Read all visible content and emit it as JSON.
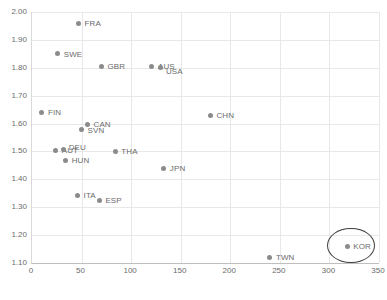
{
  "chart_data": {
    "type": "scatter",
    "title": "",
    "subtitle": "",
    "xlabel": "",
    "ylabel": "",
    "xlim": [
      0,
      350
    ],
    "ylim": [
      1.1,
      2.0
    ],
    "xticks": [
      "0",
      "50",
      "100",
      "150",
      "200",
      "250",
      "300",
      "350"
    ],
    "xtick_values": [
      0,
      50,
      100,
      150,
      200,
      250,
      300,
      350
    ],
    "yticks": [
      "1.10",
      "1.20",
      "1.30",
      "1.40",
      "1.50",
      "1.60",
      "1.70",
      "1.80",
      "1.90",
      "2.00"
    ],
    "ytick_values": [
      1.1,
      1.2,
      1.3,
      1.4,
      1.5,
      1.6,
      1.7,
      1.8,
      1.9,
      2.0
    ],
    "grid": true,
    "legend": "none",
    "point_color": "#8b8b8b",
    "label_color": "#6b6b6b",
    "points": [
      {
        "label": "FRA",
        "x": 47,
        "y": 1.96,
        "label_dx": 6,
        "label_dy": -4
      },
      {
        "label": "SWE",
        "x": 26,
        "y": 1.85,
        "label_dx": 6,
        "label_dy": -4
      },
      {
        "label": "GBR",
        "x": 70,
        "y": 1.805,
        "label_dx": 6,
        "label_dy": -4
      },
      {
        "label": "AUS",
        "x": 121,
        "y": 1.805,
        "label_dx": 6,
        "label_dy": -4
      },
      {
        "label": "USA",
        "x": 130,
        "y": 1.8,
        "label_dx": 5,
        "label_dy": -1
      },
      {
        "label": "FIN",
        "x": 10,
        "y": 1.64,
        "label_dx": 6,
        "label_dy": -4
      },
      {
        "label": "CHN",
        "x": 180,
        "y": 1.63,
        "label_dx": 6,
        "label_dy": -4
      },
      {
        "label": "CAN",
        "x": 56,
        "y": 1.598,
        "label_dx": 6,
        "label_dy": -4
      },
      {
        "label": "SVN",
        "x": 50,
        "y": 1.578,
        "label_dx": 6,
        "label_dy": -4
      },
      {
        "label": "AUT",
        "x": 24,
        "y": 1.505,
        "label_dx": 6,
        "label_dy": -4
      },
      {
        "label": "DEU",
        "x": 32,
        "y": 1.508,
        "label_dx": 5,
        "label_dy": -6
      },
      {
        "label": "THA",
        "x": 84,
        "y": 1.5,
        "label_dx": 6,
        "label_dy": -4
      },
      {
        "label": "HUN",
        "x": 34,
        "y": 1.468,
        "label_dx": 6,
        "label_dy": -4
      },
      {
        "label": "JPN",
        "x": 133,
        "y": 1.44,
        "label_dx": 6,
        "label_dy": -4
      },
      {
        "label": "ITA",
        "x": 46,
        "y": 1.343,
        "label_dx": 6,
        "label_dy": -4
      },
      {
        "label": "ESP",
        "x": 68,
        "y": 1.325,
        "label_dx": 6,
        "label_dy": -4
      },
      {
        "label": "KOR",
        "x": 318,
        "y": 1.16,
        "label_dx": 6,
        "label_dy": -4
      },
      {
        "label": "TWN",
        "x": 240,
        "y": 1.12,
        "label_dx": 6,
        "label_dy": -4
      }
    ],
    "annotations": [
      {
        "type": "ellipse",
        "shape": "ellipse",
        "target": "KOR",
        "cx": 322,
        "cy": 1.163,
        "rx": 24,
        "ry": 0.063,
        "color": "#3f3f3f"
      }
    ]
  }
}
